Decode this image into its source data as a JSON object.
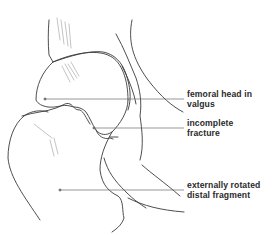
{
  "diagram": {
    "colors": {
      "stroke": "#3a3a3a",
      "light_stroke": "#8a8a8a",
      "text": "#2a2a2a",
      "background": "#ffffff"
    },
    "labels": [
      {
        "id": "femoral-head",
        "line1": "femoral head in",
        "line2": "valgus",
        "anchor": [
          45,
          99
        ],
        "x": 186,
        "y": 91
      },
      {
        "id": "incomplete-fracture",
        "line1": "incomplete",
        "line2": "fracture",
        "anchor": [
          94,
          128
        ],
        "x": 186,
        "y": 120
      },
      {
        "id": "distal-fragment",
        "line1": "externally rotated",
        "line2": "distal fragment",
        "anchor": [
          60,
          190
        ],
        "x": 186,
        "y": 182
      }
    ]
  }
}
